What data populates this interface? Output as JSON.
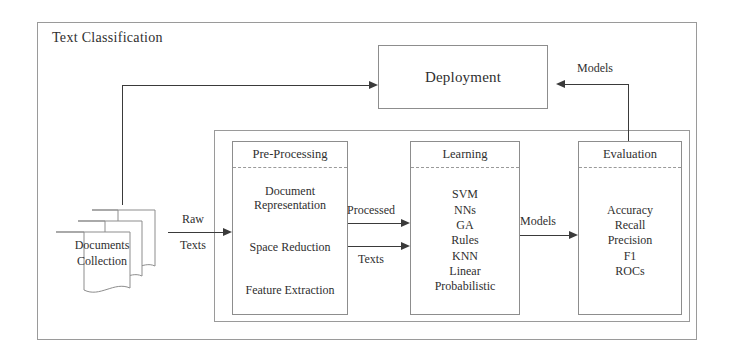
{
  "diagram": {
    "outer": {
      "title": "Text Classification"
    },
    "deployment": {
      "label": "Deployment"
    },
    "source": {
      "label_line1": "Documents",
      "label_line2": "Collection"
    },
    "stages": [
      {
        "id": "pre-processing",
        "title": "Pre-Processing",
        "items": [
          "Document Representation",
          "Space Reduction",
          "Feature Extraction"
        ]
      },
      {
        "id": "learning",
        "title": "Learning",
        "items": [
          "SVM",
          "NNs",
          "GA",
          "Rules",
          "KNN",
          "Linear",
          "Probabilistic"
        ]
      },
      {
        "id": "evaluation",
        "title": "Evaluation",
        "items": [
          "Accuracy",
          "Recall",
          "Precision",
          "F1",
          "ROCs"
        ]
      }
    ],
    "edges": [
      {
        "id": "docs-to-pre-top",
        "label": "Raw"
      },
      {
        "id": "docs-to-pre-bottom",
        "label": "Texts"
      },
      {
        "id": "pre-to-learn-top",
        "label": "Processed"
      },
      {
        "id": "pre-to-learn-bottom",
        "label": "Texts"
      },
      {
        "id": "learn-to-eval",
        "label": "Models"
      },
      {
        "id": "eval-to-deploy",
        "label": "Models"
      }
    ],
    "colors": {
      "line": "#3a3a3a",
      "box_border": "#8d8d8d",
      "container_border": "#9a9a9a",
      "text": "#2f2f2f",
      "background": "#ffffff"
    }
  }
}
